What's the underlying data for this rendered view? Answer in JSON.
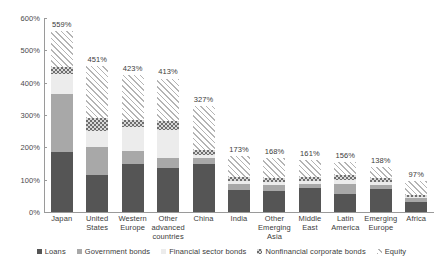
{
  "chart_data": {
    "type": "bar",
    "stacked": true,
    "title": "",
    "subtitle": "",
    "xlabel": "",
    "ylabel": "",
    "ylim": [
      0,
      600
    ],
    "ytick_labels": [
      "0%",
      "100%",
      "200%",
      "300%",
      "400%",
      "500%",
      "600%"
    ],
    "ytick_values": [
      0,
      100,
      200,
      300,
      400,
      500,
      600
    ],
    "grid": false,
    "legend_position": "bottom",
    "value_suffix": "%",
    "categories": [
      "Japan",
      "United States",
      "Western Europe",
      "Other advanced countries",
      "China",
      "India",
      "Other Emerging Asia",
      "Middle East",
      "Latin America",
      "Emerging Europe",
      "Africa"
    ],
    "totals": [
      559,
      451,
      423,
      413,
      327,
      173,
      168,
      161,
      156,
      138,
      97
    ],
    "total_labels": [
      "559%",
      "451%",
      "423%",
      "413%",
      "327%",
      "173%",
      "168%",
      "161%",
      "156%",
      "138%",
      "97%"
    ],
    "series": [
      {
        "name": "Loans",
        "key": "loans",
        "pattern": "solid",
        "color": "#555555",
        "values": [
          185,
          115,
          148,
          135,
          150,
          68,
          65,
          75,
          55,
          72,
          30
        ]
      },
      {
        "name": "Government bonds",
        "key": "govt",
        "pattern": "solid",
        "color": "#a8a8a8",
        "values": [
          180,
          85,
          42,
          33,
          18,
          18,
          18,
          12,
          33,
          12,
          14
        ]
      },
      {
        "name": "Financial sector bonds",
        "key": "fin",
        "pattern": "solid",
        "color": "#ececec",
        "values": [
          62,
          50,
          73,
          87,
          8,
          10,
          9,
          8,
          12,
          8,
          3
        ]
      },
      {
        "name": "Nonfinancial corporate bonds",
        "key": "nonfin",
        "pattern": "checkered",
        "color": "#6e6e6e",
        "values": [
          22,
          40,
          22,
          28,
          16,
          12,
          14,
          12,
          16,
          12,
          5
        ]
      },
      {
        "name": "Equity",
        "key": "equity",
        "pattern": "diagonal-hatch",
        "color": "#b4b4b4",
        "values": [
          110,
          161,
          138,
          130,
          135,
          65,
          62,
          54,
          40,
          34,
          45
        ]
      }
    ]
  }
}
